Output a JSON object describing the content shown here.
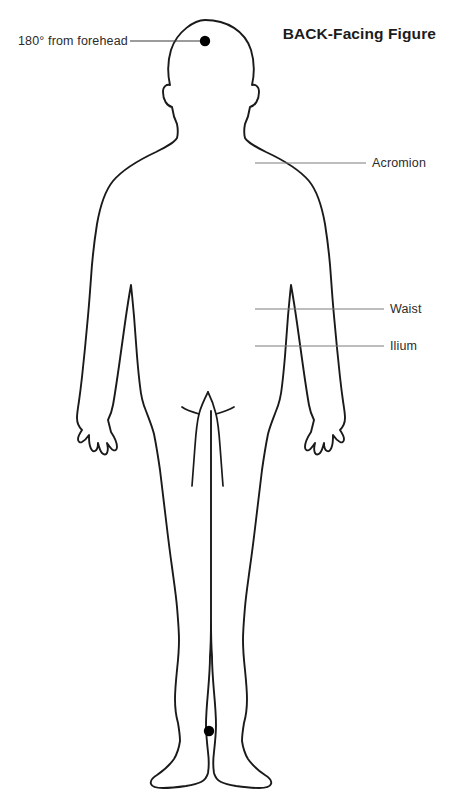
{
  "page": {
    "title": "BACK-Facing Figure",
    "figure_type": "posterior human body outline",
    "background_color": "#ffffff",
    "outline_color": "#1a1a1a",
    "leader_line_color": "#808080",
    "marker_color": "#000000"
  },
  "annotations": [
    {
      "id": "forehead-marker",
      "label": "180° from forehead",
      "label_side": "left",
      "leader": {
        "x1": 130,
        "y1": 41,
        "x2": 205,
        "y2": 41,
        "color": "#3a3a3a"
      },
      "marker": {
        "x": 205,
        "y": 41,
        "r": 5.2
      }
    },
    {
      "id": "acromion",
      "label": "Acromion",
      "label_side": "right",
      "leader": {
        "x1": 255,
        "y1": 163,
        "x2": 366,
        "y2": 163,
        "color": "#7d7d7d"
      },
      "marker": null
    },
    {
      "id": "waist",
      "label": "Waist",
      "label_side": "right",
      "leader": {
        "x1": 255,
        "y1": 309,
        "x2": 384,
        "y2": 309,
        "color": "#7d7d7d"
      },
      "marker": null
    },
    {
      "id": "ilium",
      "label": "Ilium",
      "label_side": "right",
      "leader": {
        "x1": 255,
        "y1": 346,
        "x2": 384,
        "y2": 346,
        "color": "#7d7d7d"
      },
      "marker": null
    },
    {
      "id": "ankle-marker",
      "label": "",
      "label_side": "none",
      "leader": null,
      "marker": {
        "x": 209,
        "y": 731,
        "r": 5.2
      }
    }
  ],
  "markers": [
    {
      "name": "head-vertex-dot",
      "x": 205,
      "y": 41
    },
    {
      "name": "ankle-midpoint-dot",
      "x": 209,
      "y": 731
    }
  ]
}
